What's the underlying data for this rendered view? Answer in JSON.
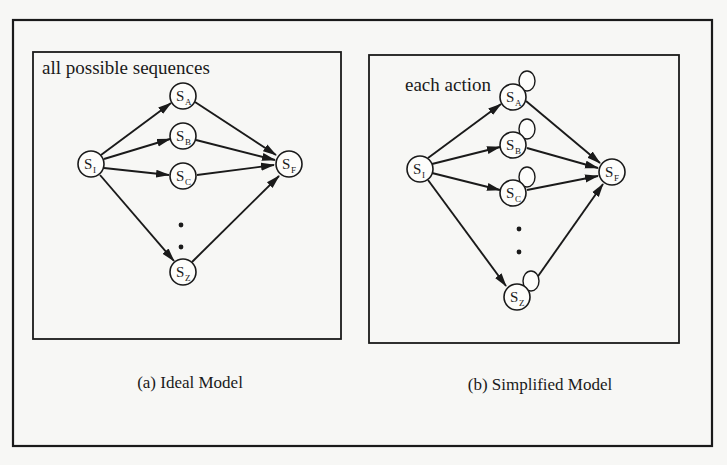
{
  "figure": {
    "panels": [
      {
        "id": "a",
        "title": "all possible sequences",
        "caption": "(a) Ideal Model",
        "self_loops": false,
        "nodes": [
          {
            "id": "SI",
            "label": "S",
            "sub": "I"
          },
          {
            "id": "SA",
            "label": "S",
            "sub": "A"
          },
          {
            "id": "SB",
            "label": "S",
            "sub": "B"
          },
          {
            "id": "SC",
            "label": "S",
            "sub": "C"
          },
          {
            "id": "SZ",
            "label": "S",
            "sub": "Z"
          },
          {
            "id": "SF",
            "label": "S",
            "sub": "F"
          }
        ],
        "edges": [
          [
            "SI",
            "SA"
          ],
          [
            "SI",
            "SB"
          ],
          [
            "SI",
            "SC"
          ],
          [
            "SI",
            "SZ"
          ],
          [
            "SA",
            "SF"
          ],
          [
            "SB",
            "SF"
          ],
          [
            "SC",
            "SF"
          ],
          [
            "SZ",
            "SF"
          ]
        ],
        "ellipsis": "⋮"
      },
      {
        "id": "b",
        "title": "each action",
        "caption": "(b) Simplified Model",
        "self_loops": true,
        "nodes": [
          {
            "id": "SI",
            "label": "S",
            "sub": "I"
          },
          {
            "id": "SA",
            "label": "S",
            "sub": "A"
          },
          {
            "id": "SB",
            "label": "S",
            "sub": "B"
          },
          {
            "id": "SC",
            "label": "S",
            "sub": "C"
          },
          {
            "id": "SZ",
            "label": "S",
            "sub": "Z"
          },
          {
            "id": "SF",
            "label": "S",
            "sub": "F"
          }
        ],
        "edges": [
          [
            "SI",
            "SA"
          ],
          [
            "SI",
            "SB"
          ],
          [
            "SI",
            "SC"
          ],
          [
            "SI",
            "SZ"
          ],
          [
            "SA",
            "SF"
          ],
          [
            "SB",
            "SF"
          ],
          [
            "SC",
            "SF"
          ],
          [
            "SZ",
            "SF"
          ],
          [
            "SA",
            "SA"
          ],
          [
            "SB",
            "SB"
          ],
          [
            "SC",
            "SC"
          ],
          [
            "SZ",
            "SZ"
          ]
        ],
        "ellipsis": "⋮"
      }
    ]
  }
}
